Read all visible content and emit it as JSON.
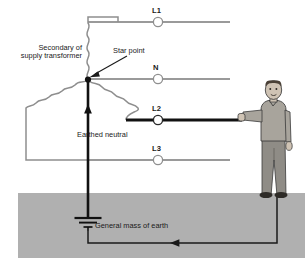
{
  "diagram": {
    "labels": {
      "secondary": "Secondary of\nsupply transformer",
      "secondary_line1": "Secondary of",
      "secondary_line2": "supply transformer",
      "star_point": "Star point",
      "earthed_neutral": "Earthed neutral",
      "general_mass": "General mass of earth"
    },
    "conductors": [
      {
        "id": "L1",
        "label": "L1",
        "y": 22,
        "style": "light",
        "terminal_x": 158,
        "x_start": 88,
        "x_end": 230
      },
      {
        "id": "N",
        "label": "N",
        "y": 79,
        "style": "light",
        "terminal_x": 158,
        "x_start": 88,
        "x_end": 230
      },
      {
        "id": "L2",
        "label": "L2",
        "y": 120,
        "style": "live",
        "terminal_x": 158,
        "x_start": 126,
        "x_end": 242
      },
      {
        "id": "L3",
        "label": "L3",
        "y": 160,
        "style": "light",
        "terminal_x": 158,
        "x_start": 88,
        "x_end": 230
      }
    ],
    "earth": {
      "band_top": 193,
      "band_label": "General mass of earth",
      "electrode_x": 88,
      "electrode_y": 218,
      "return_path_y": 243,
      "return_arrow_direction": "left"
    },
    "person": {
      "standing_on": "earth",
      "arm": "extended-left",
      "contact_conductor": "L2",
      "contact_x": 242,
      "feet_y": 196
    },
    "colors": {
      "live_conductor": "#111111",
      "light_conductor": "#9a9a9a",
      "winding": "#8e8e8e",
      "earth_band": "#b0b0b0",
      "text": "#1a1a1a",
      "person_skin": "#cfc3b4",
      "person_shirt": "#a8a49c",
      "person_trousers": "#8f8c86",
      "person_hair": "#4a4036",
      "person_shoe": "#2e2b27",
      "background": "#ffffff"
    }
  }
}
